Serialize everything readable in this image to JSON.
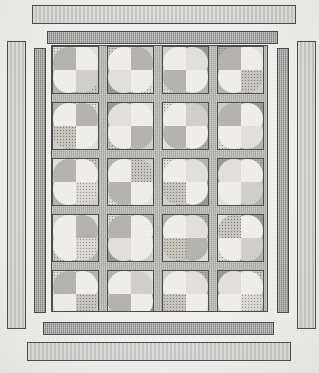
{
  "figure": {
    "kind": "quilt-pattern-diagram",
    "title": "",
    "caption": "",
    "background_color": "#f3f2f0",
    "image_width": 319,
    "image_height": 373
  },
  "palette": {
    "outline": "#4a4a4a",
    "border_light": "#cfcecb",
    "border_dark": "#a3a3a0",
    "sashing": "#b9b8b4",
    "white": "#f1f0ec",
    "cream": "#e3e2dc",
    "light_gray": "#d2d1cc",
    "medium_gray": "#b6b5b0",
    "dark_gray": "#9b9a96",
    "dotted_light": "#dedcd4",
    "dotted_medium": "#c9c7c0",
    "dotted_dark": "#b0aea7"
  },
  "layout": {
    "panel": {
      "x": 51,
      "y": 45,
      "width": 217,
      "height": 267
    },
    "grid": {
      "columns": 4,
      "rows": 5
    },
    "block_size": {
      "width": 47,
      "height": 48
    },
    "sashing_width": 8,
    "block_label": "orange-peel-block"
  },
  "borders": [
    {
      "name": "outer-top-bar",
      "style": "light",
      "x": 32,
      "y": 5,
      "width": 264,
      "height": 19
    },
    {
      "name": "inner-top-bar",
      "style": "dark",
      "x": 47,
      "y": 31,
      "width": 231,
      "height": 13
    },
    {
      "name": "outer-left-bar",
      "style": "light",
      "x": 7,
      "y": 41,
      "width": 19,
      "height": 288
    },
    {
      "name": "inner-left-bar",
      "style": "dark",
      "x": 34,
      "y": 48,
      "width": 12,
      "height": 265
    },
    {
      "name": "inner-right-bar",
      "style": "dark",
      "x": 277,
      "y": 48,
      "width": 12,
      "height": 265
    },
    {
      "name": "outer-right-bar",
      "style": "light",
      "x": 297,
      "y": 41,
      "width": 19,
      "height": 288
    },
    {
      "name": "inner-bottom-bar",
      "style": "dark",
      "x": 43,
      "y": 322,
      "width": 231,
      "height": 13
    },
    {
      "name": "outer-bottom-bar",
      "style": "light",
      "x": 27,
      "y": 342,
      "width": 264,
      "height": 19
    }
  ],
  "blocks": [
    [
      {
        "tl": "f-dot-l",
        "tr": "f-cream",
        "bl": "f-mgray",
        "br": "f-dot-m",
        "pie_tl": "f-mgray",
        "pie_tr": "f-white",
        "pie_bl": "f-white",
        "pie_br": "f-lgray"
      },
      {
        "tl": "f-dot-m",
        "tr": "f-lgray",
        "bl": "f-dgray",
        "br": "f-dot-l",
        "pie_tl": "f-white",
        "pie_tr": "f-mgray",
        "pie_bl": "f-cream",
        "pie_br": "f-white"
      },
      {
        "tl": "f-lgray",
        "tr": "f-dgray",
        "bl": "f-dot-l",
        "br": "f-mgray",
        "pie_tl": "f-white",
        "pie_tr": "f-cream",
        "pie_bl": "f-mgray",
        "pie_br": "f-white"
      },
      {
        "tl": "f-dot-d",
        "tr": "f-cream",
        "bl": "f-mgray",
        "br": "f-lgray",
        "pie_tl": "f-mgray",
        "pie_tr": "f-white",
        "pie_bl": "f-white",
        "pie_br": "f-dot-m"
      }
    ],
    [
      {
        "tl": "f-mgray",
        "tr": "f-dot-l",
        "bl": "f-lgray",
        "br": "f-cream",
        "pie_tl": "f-white",
        "pie_tr": "f-mgray",
        "pie_bl": "f-dot-m",
        "pie_br": "f-white"
      },
      {
        "tl": "f-dgray",
        "tr": "f-cream",
        "bl": "f-dot-m",
        "br": "f-lgray",
        "pie_tl": "f-cream",
        "pie_tr": "f-white",
        "pie_bl": "f-white",
        "pie_br": "f-mgray"
      },
      {
        "tl": "f-dot-l",
        "tr": "f-mgray",
        "bl": "f-cream",
        "br": "f-dot-d",
        "pie_tl": "f-white",
        "pie_tr": "f-lgray",
        "pie_bl": "f-mgray",
        "pie_br": "f-white"
      },
      {
        "tl": "f-lgray",
        "tr": "f-dgray",
        "bl": "f-dot-l",
        "br": "f-mgray",
        "pie_tl": "f-mgray",
        "pie_tr": "f-white",
        "pie_bl": "f-white",
        "pie_br": "f-cream"
      }
    ],
    [
      {
        "tl": "f-cream",
        "tr": "f-dot-m",
        "bl": "f-mgray",
        "br": "f-lgray",
        "pie_tl": "f-mgray",
        "pie_tr": "f-white",
        "pie_bl": "f-white",
        "pie_br": "f-dot-l"
      },
      {
        "tl": "f-mgray",
        "tr": "f-lgray",
        "bl": "f-dot-l",
        "br": "f-cream",
        "pie_tl": "f-white",
        "pie_tr": "f-dot-m",
        "pie_bl": "f-mgray",
        "pie_br": "f-white"
      },
      {
        "tl": "f-dot-l",
        "tr": "f-mgray",
        "bl": "f-lgray",
        "br": "f-dgray",
        "pie_tl": "f-white",
        "pie_tr": "f-cream",
        "pie_bl": "f-dot-m",
        "pie_br": "f-white"
      },
      {
        "tl": "f-dgray",
        "tr": "f-dot-d",
        "bl": "f-cream",
        "br": "f-mgray",
        "pie_tl": "f-cream",
        "pie_tr": "f-white",
        "pie_bl": "f-white",
        "pie_br": "f-lgray"
      }
    ],
    [
      {
        "tl": "f-lgray",
        "tr": "f-cream",
        "bl": "f-dot-m",
        "br": "f-mgray",
        "pie_tl": "f-white",
        "pie_tr": "f-mgray",
        "pie_bl": "f-white",
        "pie_br": "f-dot-l"
      },
      {
        "tl": "f-dot-l",
        "tr": "f-mgray",
        "bl": "f-dgray",
        "br": "f-lgray",
        "pie_tl": "f-mgray",
        "pie_tr": "f-white",
        "pie_bl": "f-cream",
        "pie_br": "f-white"
      },
      {
        "tl": "f-mgray",
        "tr": "f-dot-d",
        "bl": "f-lgray",
        "br": "f-cream",
        "pie_tl": "f-white",
        "pie_tr": "f-cream",
        "pie_bl": "f-dot-m",
        "pie_br": "f-mgray"
      },
      {
        "tl": "f-cream",
        "tr": "f-dgray",
        "bl": "f-dot-l",
        "br": "f-mgray",
        "pie_tl": "f-dot-m",
        "pie_tr": "f-white",
        "pie_bl": "f-white",
        "pie_br": "f-lgray"
      }
    ],
    [
      {
        "tl": "f-dot-l",
        "tr": "f-mgray",
        "bl": "f-cream",
        "br": "f-lgray",
        "pie_tl": "f-mgray",
        "pie_tr": "f-white",
        "pie_bl": "f-white",
        "pie_br": "f-dot-m"
      },
      {
        "tl": "f-mgray",
        "tr": "f-cream",
        "bl": "f-dot-l",
        "br": "f-dgray",
        "pie_tl": "f-white",
        "pie_tr": "f-lgray",
        "pie_bl": "f-mgray",
        "pie_br": "f-white"
      },
      {
        "tl": "f-lgray",
        "tr": "f-dot-d",
        "bl": "f-mgray",
        "br": "f-cream",
        "pie_tl": "f-white",
        "pie_tr": "f-cream",
        "pie_bl": "f-dot-m",
        "pie_br": "f-white"
      },
      {
        "tl": "f-dgray",
        "tr": "f-dot-m",
        "bl": "f-lgray",
        "br": "f-mgray",
        "pie_tl": "f-cream",
        "pie_tr": "f-white",
        "pie_bl": "f-white",
        "pie_br": "f-dot-l"
      }
    ]
  ]
}
